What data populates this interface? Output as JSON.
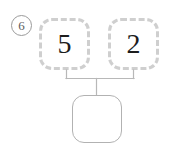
{
  "problem": {
    "number_label": "6",
    "type": "number-bond",
    "parts": [
      {
        "id": "part-left",
        "value": "5",
        "filled": true
      },
      {
        "id": "part-right",
        "value": "2",
        "filled": true
      }
    ],
    "whole": {
      "value": "",
      "filled": false
    },
    "colors": {
      "part_border": "#cfcfcf",
      "whole_border": "#b2b2b2",
      "connector": "#b8b8b8",
      "number_text": "#1d1d1d",
      "problem_number_text": "#5d5d5d",
      "background": "#ffffff"
    }
  }
}
